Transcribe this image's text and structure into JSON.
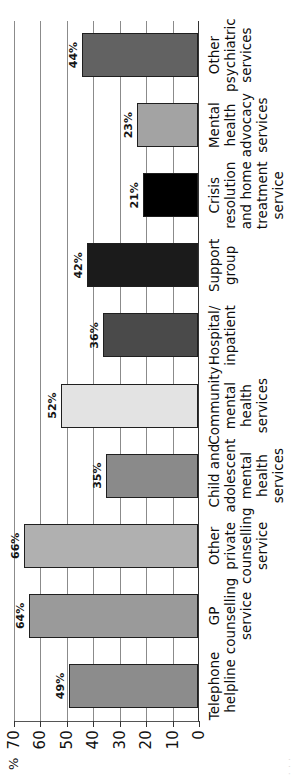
{
  "chart_data": {
    "type": "bar",
    "title": "",
    "xlabel": "",
    "ylabel": "%",
    "ylim": [
      0,
      70
    ],
    "grid": true,
    "legend": "none",
    "orientation": "vertical-rotated-90ccw",
    "yticks": [
      "0",
      "10",
      "20",
      "30",
      "40",
      "50",
      "60",
      "70"
    ],
    "categories": [
      "Telephone helpline",
      "GP counselling service",
      "Other private counselling service",
      "Child and adolescent mental health services",
      "Community mental health services",
      "Hospital/ inpatient",
      "Support group",
      "Crisis resolution and home treatment service",
      "Mental health advocacy services",
      "Other psychiatric services"
    ],
    "values": [
      49,
      64,
      66,
      35,
      52,
      36,
      42,
      21,
      23,
      44
    ],
    "value_labels": [
      "49%",
      "64%",
      "66%",
      "35%",
      "52%",
      "36%",
      "42%",
      "21%",
      "23%",
      "44%"
    ],
    "bar_colors": [
      "#8c8c8c",
      "#9a9a9a",
      "#b0b0b0",
      "#8a8a8a",
      "#e3e3e3",
      "#4a4a4a",
      "#1b1b1b",
      "#000000",
      "#a3a3a3",
      "#626262"
    ]
  },
  "axis": {
    "percent_symbol": "%"
  },
  "artifact": {
    "top_edge_text": "· · ·"
  }
}
